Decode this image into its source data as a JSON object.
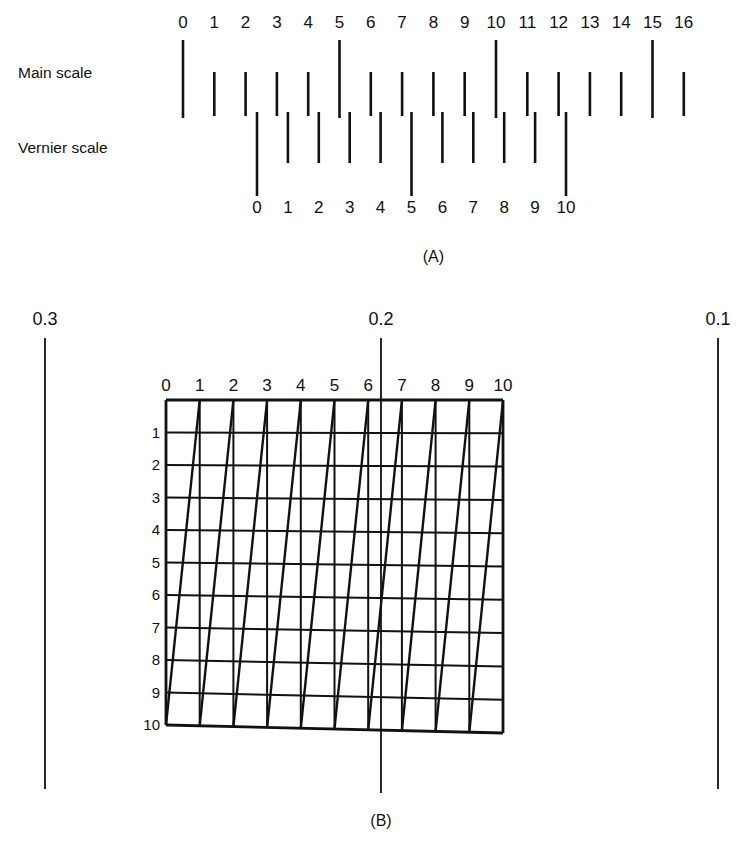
{
  "figure": {
    "panel_a": {
      "caption": "(A)",
      "main_scale": {
        "label": "Main scale",
        "tick_labels": [
          "0",
          "1",
          "2",
          "3",
          "4",
          "5",
          "6",
          "7",
          "8",
          "9",
          "10",
          "11",
          "12",
          "13",
          "14",
          "15",
          "16"
        ],
        "long_tick_values": [
          0,
          5,
          10,
          15
        ],
        "tick_start_x": 183,
        "tick_spacing": 31.3,
        "label_y": 28,
        "tick_top_y": 40,
        "short_tick_bottom_y": 116,
        "long_tick_bottom_y": 118,
        "short_tick_top_y": 72
      },
      "vernier_scale": {
        "label": "Vernier scale",
        "tick_labels": [
          "0",
          "1",
          "2",
          "3",
          "4",
          "5",
          "6",
          "7",
          "8",
          "9",
          "10"
        ],
        "long_tick_values": [
          0,
          5,
          10
        ],
        "tick_start_x": 257,
        "tick_spacing": 30.9,
        "label_y": 213,
        "tick_top_y": 112,
        "short_tick_bottom_y": 163,
        "long_tick_bottom_y": 196
      },
      "row_label_x": 18,
      "main_scale_label_y": 78,
      "vernier_scale_label_y": 153
    },
    "panel_b": {
      "caption": "(B)",
      "caption_x": 381,
      "caption_y": 826,
      "grid": {
        "column_labels": [
          "0",
          "1",
          "2",
          "3",
          "4",
          "5",
          "6",
          "7",
          "8",
          "9",
          "10"
        ],
        "row_labels": [
          "1",
          "2",
          "3",
          "4",
          "5",
          "6",
          "7",
          "8",
          "9",
          "10"
        ],
        "columns": 10,
        "rows": 10,
        "left_x": 166,
        "right_x": 503,
        "top_y": 400,
        "bottom_left_y": 725,
        "bottom_right_y": 733,
        "column_label_y": 391,
        "row_label_x": 160
      },
      "reference_lines": [
        {
          "value": "0.3",
          "x": 45,
          "label_y": 325,
          "top_y": 338,
          "bottom_y": 789
        },
        {
          "value": "0.2",
          "x": 381,
          "label_y": 325,
          "top_y": 338,
          "bottom_y": 793
        },
        {
          "value": "0.1",
          "x": 718,
          "label_y": 325,
          "top_y": 338,
          "bottom_y": 789
        }
      ]
    }
  },
  "colors": {
    "ink": "#111111",
    "background": "#ffffff"
  }
}
